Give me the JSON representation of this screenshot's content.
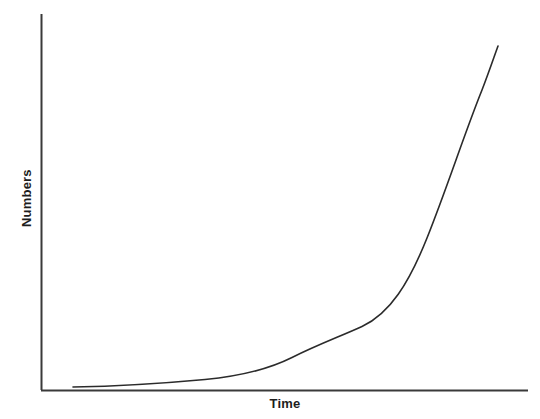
{
  "chart_data": {
    "type": "line",
    "title": "",
    "subtitle": "",
    "xlabel": "Time",
    "ylabel": "Numbers",
    "legend": [],
    "legend_position": "none",
    "grid": false,
    "xticks": [],
    "yticks": [],
    "xlim": [
      0,
      1
    ],
    "ylim": [
      0,
      1
    ],
    "annotations": [],
    "series": [
      {
        "name": "exponential growth",
        "color": "#2b2b2b",
        "line_width": 1.6,
        "points": [
          {
            "x": 0.07,
            "y": 0.008
          },
          {
            "x": 0.145,
            "y": 0.013
          },
          {
            "x": 0.232,
            "y": 0.021
          },
          {
            "x": 0.296,
            "y": 0.043
          },
          {
            "x": 0.409,
            "y": 0.101
          },
          {
            "x": 0.501,
            "y": 0.128
          },
          {
            "x": 0.573,
            "y": 0.168
          },
          {
            "x": 0.675,
            "y": 0.232
          },
          {
            "x": 0.777,
            "y": 0.404
          },
          {
            "x": 0.87,
            "y": 0.638
          },
          {
            "x": 0.938,
            "y": 0.915
          }
        ]
      }
    ],
    "axes": {
      "color": "#3a3a3a",
      "line_width": 2,
      "origin": {
        "x": 41,
        "y": 390
      },
      "y_top": 14,
      "x_right": 528
    }
  },
  "curve_path": "M 73 387 C 120 386.2 165 383.2 205 379.5 C 240 376.2 268 369.5 292 357.5 C 318 344.5 340 336.5 362 326.5 C 390 313.5 409 283 427 238 C 447 188 465 132 482 90 C 489 72 494 57 498 46",
  "axis_paths": {
    "y_axis": "M 41.5 14 L 41.5 390",
    "x_axis": "M 41 390.5 L 528 390.5"
  }
}
